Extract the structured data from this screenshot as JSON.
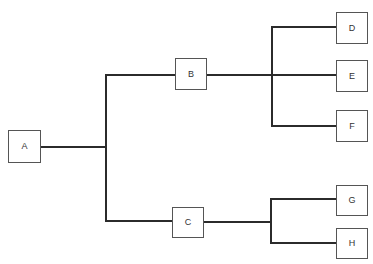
{
  "diagram": {
    "type": "hierarchical-tree",
    "title": "",
    "background_color": "#ffffff",
    "node_fill_color": "#ffffff",
    "node_border_color": "#555555",
    "connector_color": "#2b2b2b",
    "label_color": "#333333",
    "nodes": [
      {
        "id": "A",
        "label": "A",
        "x": 8,
        "y": 130,
        "w": 33,
        "h": 33,
        "level": 0
      },
      {
        "id": "B",
        "label": "B",
        "x": 175,
        "y": 58,
        "w": 32,
        "h": 32,
        "level": 1
      },
      {
        "id": "C",
        "label": "C",
        "x": 172,
        "y": 207,
        "w": 32,
        "h": 31,
        "level": 1
      },
      {
        "id": "D",
        "label": "D",
        "x": 336,
        "y": 12,
        "w": 32,
        "h": 32,
        "level": 2
      },
      {
        "id": "E",
        "label": "E",
        "x": 336,
        "y": 60,
        "w": 32,
        "h": 32,
        "level": 2
      },
      {
        "id": "F",
        "label": "F",
        "x": 336,
        "y": 110,
        "w": 32,
        "h": 32,
        "level": 2
      },
      {
        "id": "G",
        "label": "G",
        "x": 336,
        "y": 185,
        "w": 32,
        "h": 31,
        "level": 2
      },
      {
        "id": "H",
        "label": "H",
        "x": 336,
        "y": 228,
        "w": 32,
        "h": 31,
        "level": 2
      }
    ],
    "edges": [
      {
        "from": "A",
        "to": "B"
      },
      {
        "from": "A",
        "to": "C"
      },
      {
        "from": "B",
        "to": "D"
      },
      {
        "from": "B",
        "to": "E"
      },
      {
        "from": "B",
        "to": "F"
      },
      {
        "from": "C",
        "to": "G"
      },
      {
        "from": "C",
        "to": "H"
      }
    ],
    "connector_paths": [
      "M41,147 L106,147",
      "M106,75 L106,221",
      "M106,75 L175,75",
      "M106,221 L172,221",
      "M207,75 L336,75",
      "M272,27 L272,126",
      "M272,27 L336,27",
      "M272,126 L336,126",
      "M204,222 L271,222",
      "M271,199 L271,243",
      "M271,199 L336,199",
      "M271,243 L336,243"
    ]
  }
}
